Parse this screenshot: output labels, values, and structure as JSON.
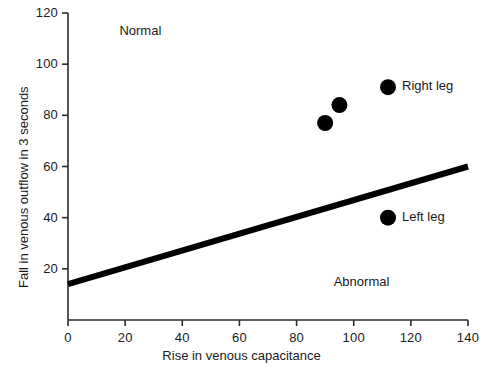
{
  "chart_data": {
    "type": "scatter",
    "title": "",
    "xlabel": "Rise in venous capacitance",
    "ylabel": "Fall in venous outflow in 3 seconds",
    "xlim": [
      0,
      140
    ],
    "ylim": [
      0,
      120
    ],
    "xticks": [
      0,
      20,
      40,
      60,
      80,
      100,
      120,
      140
    ],
    "yticks": [
      20,
      40,
      60,
      80,
      100,
      120
    ],
    "xtick_labels": [
      "0",
      "20",
      "40",
      "60",
      "80",
      "100",
      "120",
      "140"
    ],
    "ytick_labels": [
      "20",
      "40",
      "60",
      "80",
      "100",
      "120"
    ],
    "grid": false,
    "legend": "none",
    "marker_color": "#000000",
    "line_color": "#000000",
    "points": [
      {
        "x": 90,
        "y": 77,
        "label": ""
      },
      {
        "x": 95,
        "y": 84,
        "label": ""
      },
      {
        "x": 112,
        "y": 91,
        "label": "Right leg"
      },
      {
        "x": 112,
        "y": 40,
        "label": "Left leg"
      }
    ],
    "threshold_line": {
      "name": "normal-abnormal boundary",
      "x1": 0,
      "y1": 14,
      "x2": 140,
      "y2": 60
    },
    "annotations": [
      {
        "text": "Normal",
        "x": 18,
        "y": 113
      },
      {
        "text": "Abnormal",
        "x": 93,
        "y": 15
      }
    ]
  }
}
